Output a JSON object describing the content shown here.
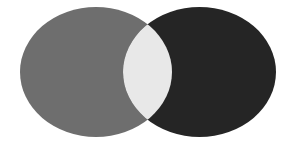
{
  "diagram": {
    "type": "venn",
    "sets": [
      {
        "name": "left-set",
        "color": "#6e6e6e",
        "cx": 96,
        "cy": 72,
        "rx": 76,
        "ry": 65
      },
      {
        "name": "right-set",
        "color": "#252525",
        "cx": 199.5,
        "cy": 72,
        "rx": 76.5,
        "ry": 65
      }
    ],
    "intersection": {
      "color": "#e8e8e8"
    },
    "background": "#ffffff"
  }
}
